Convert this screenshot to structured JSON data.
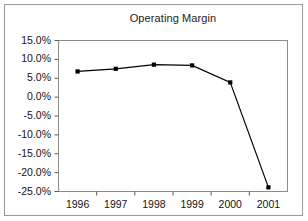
{
  "figure": {
    "background_color": "#ffffff",
    "frame_color": "#9a9a9a"
  },
  "chart_data": {
    "type": "line",
    "title": "Operating Margin",
    "xlabel": "",
    "ylabel": "",
    "categories": [
      "1996",
      "1997",
      "1998",
      "1999",
      "2000",
      "2001"
    ],
    "values": [
      0.068,
      0.075,
      0.086,
      0.084,
      0.039,
      -0.239
    ],
    "value_labels": [
      "6.8%",
      "7.5%",
      "8.6%",
      "8.4%",
      "3.9%",
      "-23.9%"
    ],
    "ylim": [
      -0.25,
      0.15
    ],
    "ytick_values": [
      0.15,
      0.1,
      0.05,
      0.0,
      -0.05,
      -0.1,
      -0.15,
      -0.2,
      -0.25
    ],
    "ytick_labels": [
      "15.0%",
      "10.0%",
      "5.0%",
      "0.0%",
      "-5.0%",
      "-10.0%",
      "-15.0%",
      "-20.0%",
      "-25.0%"
    ],
    "xtick_labels": [
      "1996",
      "1997",
      "1998",
      "1999",
      "2000",
      "2001"
    ],
    "grid": false,
    "legend": null,
    "legend_position": "none",
    "series_color": "#000000",
    "marker": "square",
    "plot_border_color": "#8c8c8c"
  }
}
